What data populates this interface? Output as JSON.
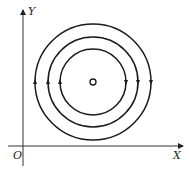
{
  "diagram": {
    "type": "concentric field lines around a point",
    "axes": {
      "x_label": "X",
      "y_label": "Y",
      "origin_label": "O"
    },
    "center": {
      "x": 93,
      "y": 82,
      "marker": "small open circle",
      "r": 3
    },
    "circles": [
      {
        "name": "inner",
        "r": 33
      },
      {
        "name": "middle",
        "r": 45
      },
      {
        "name": "outer",
        "r": 58
      }
    ],
    "direction": "clockwise",
    "colors": {
      "line": "#1a1a1a",
      "background": "#ffffff"
    }
  }
}
